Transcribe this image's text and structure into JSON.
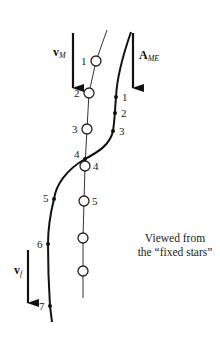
{
  "diagram": {
    "caption": {
      "line1": "Viewed from",
      "line2": "the “fixed stars”"
    },
    "vectors": {
      "v_M": {
        "symbol": "v",
        "subscript": "M"
      },
      "A_ME": {
        "symbol": "A",
        "subscript": "ME"
      },
      "v_f": {
        "symbol": "v",
        "subscript": "f"
      }
    },
    "moon_path_points": [
      "1",
      "2",
      "3",
      "4",
      "5",
      "",
      ""
    ],
    "object_path_points": [
      "1",
      "2",
      "3",
      "4",
      "5",
      "6",
      "7"
    ],
    "labels": {
      "m1": "1",
      "m2": "2",
      "m3": "3",
      "m4": "4",
      "m5": "5",
      "o1": "1",
      "o2": "2",
      "o3": "3",
      "o4": "4",
      "o5": "5",
      "o6": "6",
      "o7": "7"
    }
  }
}
